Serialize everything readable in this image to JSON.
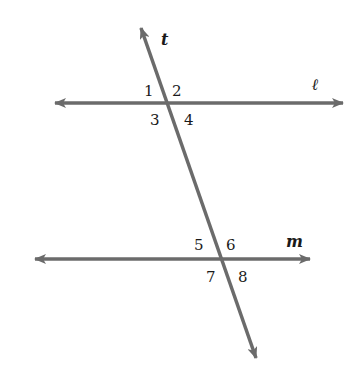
{
  "diagram": {
    "line_color": "#6b6b6b",
    "text_color": "#1a1a1a",
    "lines": [
      {
        "id": "l",
        "label": "ℓ",
        "role": "parallel line (upper)"
      },
      {
        "id": "m",
        "label": "m",
        "role": "parallel line (lower)"
      },
      {
        "id": "t",
        "label": "t",
        "role": "transversal"
      }
    ],
    "angles": [
      {
        "number": "1",
        "at": "ℓ",
        "position": "upper-left"
      },
      {
        "number": "2",
        "at": "ℓ",
        "position": "upper-right"
      },
      {
        "number": "3",
        "at": "ℓ",
        "position": "lower-left"
      },
      {
        "number": "4",
        "at": "ℓ",
        "position": "lower-right"
      },
      {
        "number": "5",
        "at": "m",
        "position": "upper-left"
      },
      {
        "number": "6",
        "at": "m",
        "position": "upper-right"
      },
      {
        "number": "7",
        "at": "m",
        "position": "lower-left"
      },
      {
        "number": "8",
        "at": "m",
        "position": "lower-right"
      }
    ]
  }
}
